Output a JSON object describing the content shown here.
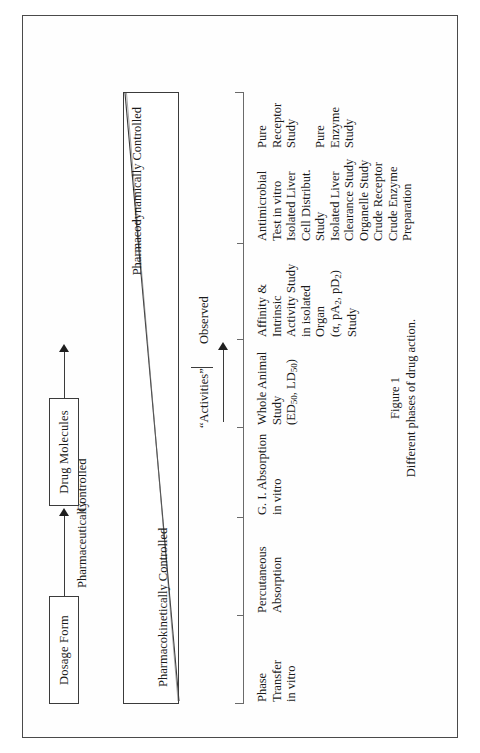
{
  "figure": {
    "caption_number": "Figure 1",
    "caption_text": "Different phases of drug action.",
    "boxes": {
      "dosage_form": "Dosage Form",
      "drug_molecules": "Drug Molecules"
    },
    "connector_labels": {
      "pharmaceutically": "Pharmaceutically",
      "controlled": "Controlled"
    },
    "triangle_labels": {
      "pharmacokinetically_controlled": "Pharmacokinetically Controlled",
      "pharmacodynamically_controlled": "Pharmacodynamically Controlled"
    },
    "activities_row": {
      "activities": "“Activities”",
      "observed": "Observed"
    },
    "columns": [
      {
        "id": "phase-transfer",
        "lines": [
          "Phase",
          "Transfer",
          "in vitro"
        ]
      },
      {
        "id": "percutaneous-absorption",
        "lines": [
          "Percutaneous",
          "Absorption"
        ]
      },
      {
        "id": "gi-absorption",
        "lines": [
          "G. I. Absorption",
          "in vitro"
        ]
      },
      {
        "id": "whole-animal-study",
        "lines": [
          "Whole Animal",
          "Study",
          "(ED<sub>50</sub>, LD<sub>50</sub>)"
        ]
      },
      {
        "id": "affinity-intrinsic-activity",
        "lines": [
          "Affinity &",
          "Intrinsic",
          "Activity Study",
          "in isolated",
          "Organ",
          "(α, pA<sub>2</sub>, pD<sub>2</sub>)",
          "Study"
        ]
      },
      {
        "id": "antimicrobial-isolated-liver",
        "lines": [
          "Antimicrobial",
          "Test in vitro",
          "Isolated Liver",
          "Cell Distribut.",
          "Study",
          "Isolated Liver",
          "Clearance Study",
          "Organelle Study",
          "Crude Receptor",
          "Crude Enzyme",
          "Preparation"
        ]
      },
      {
        "id": "pure-receptor-enzyme",
        "lines": [
          "Pure",
          "Receptor",
          "Study",
          "",
          "Pure",
          "Enzyme",
          "Study"
        ]
      }
    ]
  },
  "colors": {
    "ink": "#1a1a1a",
    "rule": "#3b3b3b",
    "page_border": "#4a4a4a",
    "paper": "#ffffff"
  }
}
